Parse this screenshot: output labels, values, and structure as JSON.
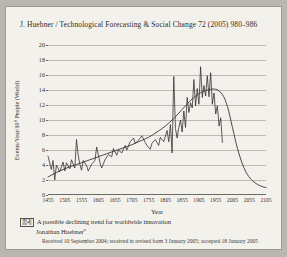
{
  "page": {
    "running_head": "J. Huebner / Technological Forecasting & Social Change 72 (2005) 980–986"
  },
  "caption": {
    "marker": "思考",
    "title": "A possible declining trend for worldwide innovation",
    "author": "Jonathan Huebner",
    "author_mark": "a",
    "received": "Received 10 September 2004; received in revised form 3 January 2005; accepted 18 January 2005"
  },
  "chart_data": {
    "type": "line",
    "title": "",
    "xlabel": "Year",
    "ylabel": "Events/Year/10⁹ People (World)",
    "xlim": [
      1455,
      2105
    ],
    "ylim": [
      0,
      20
    ],
    "yticks": [
      0,
      2,
      4,
      6,
      8,
      10,
      12,
      14,
      16,
      18,
      20
    ],
    "xticks": [
      1455,
      1505,
      1555,
      1605,
      1655,
      1705,
      1755,
      1805,
      1855,
      1905,
      1955,
      2005,
      2055,
      2105
    ],
    "grid": true,
    "legend": "none",
    "series": [
      {
        "name": "Innovation rate (raw)",
        "type": "jagged",
        "color": "#2b2825",
        "x": [
          1455,
          1465,
          1470,
          1475,
          1480,
          1490,
          1500,
          1505,
          1510,
          1520,
          1525,
          1535,
          1540,
          1545,
          1550,
          1555,
          1560,
          1570,
          1575,
          1585,
          1595,
          1600,
          1610,
          1615,
          1625,
          1635,
          1645,
          1650,
          1660,
          1665,
          1675,
          1685,
          1690,
          1700,
          1710,
          1715,
          1725,
          1735,
          1745,
          1750,
          1760,
          1765,
          1775,
          1785,
          1790,
          1800,
          1810,
          1815,
          1820,
          1825,
          1830,
          1835,
          1840,
          1845,
          1850,
          1855,
          1860,
          1865,
          1870,
          1875,
          1880,
          1885,
          1890,
          1895,
          1900,
          1905,
          1910,
          1915,
          1920,
          1925,
          1930,
          1935,
          1940,
          1945,
          1950,
          1955,
          1960,
          1965,
          1970,
          1975
        ],
        "y": [
          5.2,
          3.4,
          4.6,
          2.0,
          4.0,
          3.1,
          4.4,
          3.2,
          4.3,
          3.5,
          4.7,
          3.6,
          7.4,
          5.3,
          4.1,
          3.3,
          4.6,
          3.9,
          3.2,
          4.1,
          4.6,
          6.4,
          4.3,
          3.6,
          4.7,
          5.4,
          5.1,
          6.2,
          5.3,
          6.0,
          5.6,
          6.6,
          6.0,
          7.1,
          7.6,
          6.9,
          7.3,
          7.9,
          7.0,
          6.6,
          6.1,
          6.9,
          7.4,
          6.6,
          7.7,
          7.1,
          8.6,
          7.1,
          9.4,
          5.6,
          15.8,
          8.9,
          7.6,
          9.0,
          10.0,
          8.4,
          11.2,
          9.0,
          13.0,
          11.0,
          12.3,
          11.6,
          15.4,
          11.9,
          14.2,
          12.1,
          17.1,
          13.0,
          14.6,
          13.2,
          15.9,
          13.1,
          16.3,
          12.1,
          13.6,
          10.8,
          11.9,
          9.2,
          10.3,
          7.0
        ]
      },
      {
        "name": "Trend (smoothed)",
        "type": "smooth",
        "color": "#3a3734",
        "x": [
          1455,
          1480,
          1505,
          1530,
          1555,
          1580,
          1605,
          1630,
          1655,
          1680,
          1705,
          1730,
          1755,
          1780,
          1805,
          1830,
          1855,
          1880,
          1905,
          1930,
          1955,
          1975,
          1990,
          2005,
          2020,
          2035,
          2050,
          2065,
          2080,
          2095,
          2105
        ],
        "y": [
          2.4,
          3.0,
          3.5,
          3.9,
          4.3,
          4.7,
          5.1,
          5.5,
          5.9,
          6.3,
          6.7,
          7.2,
          7.7,
          8.4,
          9.2,
          10.2,
          11.4,
          12.6,
          13.5,
          14.0,
          14.1,
          13.4,
          11.8,
          9.0,
          6.2,
          4.1,
          2.7,
          1.9,
          1.4,
          1.1,
          1.0
        ]
      }
    ]
  }
}
